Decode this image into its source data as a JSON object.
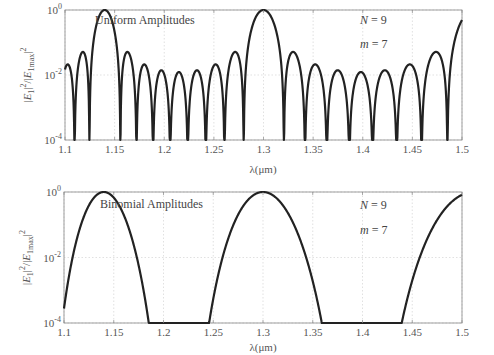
{
  "chart_data": [
    {
      "type": "line",
      "title": "Uniform Amplitudes",
      "xlabel": "λ(μm)",
      "ylabel": "|E1|²/|E1max|²",
      "xlim": [
        1.1,
        1.5
      ],
      "ylim_log10": [
        -4,
        0
      ],
      "yscale": "log",
      "grid": true,
      "xticks": [
        "1.1",
        "1.15",
        "1.2",
        "1.25",
        "1.3",
        "1.35",
        "1.4",
        "1.45",
        "1.5"
      ],
      "yticks": [
        {
          "base": "10",
          "exp": "0"
        },
        {
          "base": "10",
          "exp": "-2"
        },
        {
          "base": "10",
          "exp": "-4"
        }
      ],
      "annotations": [
        {
          "text": "N = 9",
          "var": "N",
          "value": "9"
        },
        {
          "text": "m = 7",
          "var": "m",
          "value": "7"
        }
      ],
      "model": {
        "kind": "uniform",
        "N": 9,
        "peak_wavelengths": [
          1.14,
          1.3
        ]
      },
      "peaks": [
        {
          "x": 1.14,
          "y": 1.0
        },
        {
          "x": 1.3,
          "y": 1.0
        }
      ],
      "sidelobe_levels_approx": [
        {
          "x": 1.118,
          "y": 0.05
        },
        {
          "x": 1.162,
          "y": 0.05
        },
        {
          "x": 1.179,
          "y": 0.02
        },
        {
          "x": 1.196,
          "y": 0.013
        },
        {
          "x": 1.214,
          "y": 0.011
        },
        {
          "x": 1.232,
          "y": 0.013
        },
        {
          "x": 1.251,
          "y": 0.02
        },
        {
          "x": 1.27,
          "y": 0.05
        },
        {
          "x": 1.331,
          "y": 0.05
        },
        {
          "x": 1.353,
          "y": 0.02
        },
        {
          "x": 1.376,
          "y": 0.013
        },
        {
          "x": 1.4,
          "y": 0.011
        },
        {
          "x": 1.424,
          "y": 0.013
        },
        {
          "x": 1.45,
          "y": 0.02
        },
        {
          "x": 1.477,
          "y": 0.05
        }
      ]
    },
    {
      "type": "line",
      "title": "Binomial Amplitudes",
      "xlabel": "λ(μm)",
      "ylabel": "|E1|²/|E1max|²",
      "xlim": [
        1.1,
        1.5
      ],
      "ylim_log10": [
        -4,
        0
      ],
      "yscale": "log",
      "grid": true,
      "xticks": [
        "1.1",
        "1.15",
        "1.2",
        "1.25",
        "1.3",
        "1.35",
        "1.4",
        "1.45",
        "1.5"
      ],
      "yticks": [
        {
          "base": "10",
          "exp": "0"
        },
        {
          "base": "10",
          "exp": "-2"
        },
        {
          "base": "10",
          "exp": "-4"
        }
      ],
      "annotations": [
        {
          "text": "N = 9",
          "var": "N",
          "value": "9"
        },
        {
          "text": "m = 7",
          "var": "m",
          "value": "7"
        }
      ],
      "model": {
        "kind": "binomial",
        "N": 9,
        "peak_wavelengths": [
          1.14,
          1.3
        ]
      },
      "peaks": [
        {
          "x": 1.14,
          "y": 1.0
        },
        {
          "x": 1.3,
          "y": 1.0
        }
      ],
      "floor_crossings": [
        1.183,
        1.245,
        1.361,
        1.443
      ],
      "edge_values": [
        {
          "x": 1.1,
          "y": 0.0006
        },
        {
          "x": 1.5,
          "y": 0.6
        }
      ]
    }
  ],
  "style": {
    "line_color": "#222222",
    "axis_color": "#888888",
    "grid_color": "#cccccc"
  }
}
